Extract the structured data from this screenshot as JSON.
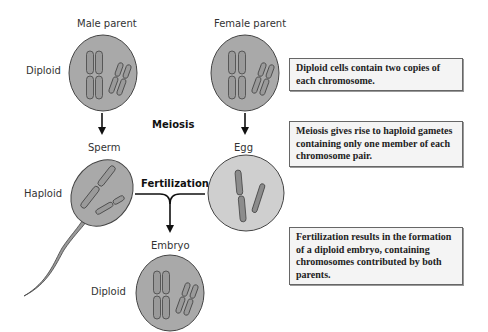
{
  "labels": {
    "male_parent": "Male parent",
    "female_parent": "Female parent",
    "diploid_top": "Diploid",
    "meiosis": "Meiosis",
    "sperm": "Sperm",
    "egg": "Egg",
    "haploid": "Haploid",
    "fertilization": "Fertilization",
    "embryo": "Embryo",
    "diploid_bottom": "Diploid"
  },
  "notes": [
    {
      "text": "Diploid cells contain two copies of each chromosome."
    },
    {
      "text": "Meiosis gives rise to haploid gametes containing only one member of each chromosome pair."
    },
    {
      "text": "Fertilization results in the formation of a diploid embryo, containing chromosomes contributed by both parents."
    }
  ],
  "colors": {
    "cell_dark": "#a9a9a9",
    "cell_light": "#cfcfcf",
    "outline": "#444444",
    "chromosome": "#8c8c8c"
  }
}
